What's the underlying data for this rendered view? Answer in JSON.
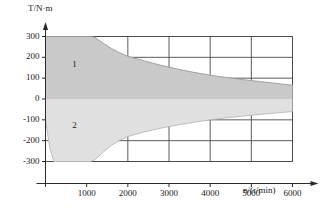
{
  "chart_data": {
    "type": "area",
    "title": "",
    "subtitle": "",
    "xlabel": "n/(r/min)",
    "ylabel": "T/N·m",
    "xlim": [
      0,
      6500
    ],
    "ylim": [
      -330,
      330
    ],
    "grid": true,
    "legend_position": "none",
    "xticks": [
      1000,
      2000,
      3000,
      4000,
      5000,
      6000
    ],
    "xtick_labels": [
      "1000",
      "2000",
      "3000",
      "4000",
      "5000",
      "6000"
    ],
    "yticks": [
      300,
      200,
      100,
      0,
      -100,
      -200,
      -300
    ],
    "ytick_labels": [
      "300",
      "200",
      "100",
      "0",
      "-100",
      "-200",
      "-300"
    ],
    "annotations": [
      {
        "text": "1",
        "x": 700,
        "y": 165,
        "note": "motoring quadrant, upper shaded band"
      },
      {
        "text": "2",
        "x": 700,
        "y": -130,
        "note": "generating quadrant, lower shaded band"
      }
    ],
    "series": [
      {
        "name": "1",
        "fill": "#c9c9c9",
        "x": [
          0,
          200,
          600,
          1000,
          1100,
          1200,
          1400,
          1600,
          1800,
          2000,
          2400,
          2800,
          3200,
          3600,
          4000,
          4400,
          4800,
          5200,
          5600,
          6000
        ],
        "upper": [
          300,
          300,
          300,
          300,
          300,
          296,
          268,
          243,
          222,
          205,
          183,
          162,
          144,
          128,
          114,
          103,
          93,
          84,
          75,
          66
        ],
        "lower": [
          0,
          0,
          0,
          0,
          0,
          0,
          0,
          0,
          0,
          0,
          0,
          0,
          0,
          0,
          0,
          0,
          0,
          0,
          0,
          0
        ]
      },
      {
        "name": "2",
        "fill": "#e0e0e0",
        "x": [
          0,
          100,
          200,
          400,
          600,
          800,
          1000,
          1100,
          1200,
          1400,
          1600,
          1800,
          2000,
          2400,
          2800,
          3200,
          3600,
          4000,
          4400,
          4800,
          5200,
          5600,
          6000
        ],
        "upper": [
          0,
          0,
          0,
          0,
          0,
          0,
          0,
          0,
          0,
          0,
          0,
          0,
          0,
          0,
          0,
          0,
          0,
          0,
          0,
          0,
          0,
          0,
          0
        ],
        "lower": [
          -100,
          -230,
          -300,
          -300,
          -300,
          -300,
          -300,
          -300,
          -292,
          -255,
          -222,
          -198,
          -180,
          -158,
          -140,
          -125,
          -112,
          -100,
          -90,
          -82,
          -74,
          -67,
          -60
        ]
      }
    ]
  },
  "axis": {
    "y_label": "T/N·m",
    "x_label": "n/(r/min)"
  }
}
